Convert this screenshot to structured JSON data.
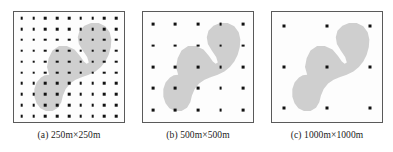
{
  "figure": {
    "background_color": "#ffffff",
    "panel_count": 3
  },
  "style": {
    "blob_fill": "#cfcfcf",
    "blob_stroke": "none",
    "dot_color": "#111111",
    "box_border_color": "#5a5a5a",
    "box_background": "#fdfdfd"
  },
  "chart_data": {
    "type": "scatter",
    "title": "",
    "subtitle": "",
    "xlabel": "",
    "ylabel": "",
    "xlim": [
      0,
      100
    ],
    "ylim": [
      0,
      100
    ],
    "grid": false,
    "legend": null,
    "shared_region": {
      "name": "shaded-region",
      "fill": "#cfcfcf",
      "polygon": [
        [
          32.0,
          57.0
        ],
        [
          30.0,
          50.0
        ],
        [
          31.5,
          42.0
        ],
        [
          35.0,
          35.0
        ],
        [
          41.0,
          31.0
        ],
        [
          48.0,
          31.0
        ],
        [
          55.0,
          34.0
        ],
        [
          60.0,
          40.0
        ],
        [
          63.5,
          45.0
        ],
        [
          66.0,
          47.0
        ],
        [
          68.0,
          46.0
        ],
        [
          66.5,
          41.0
        ],
        [
          62.5,
          35.0
        ],
        [
          59.0,
          29.0
        ],
        [
          58.0,
          23.0
        ],
        [
          59.5,
          17.0
        ],
        [
          64.0,
          12.5
        ],
        [
          70.0,
          10.0
        ],
        [
          77.0,
          10.0
        ],
        [
          83.0,
          13.0
        ],
        [
          87.0,
          18.5
        ],
        [
          88.5,
          25.0
        ],
        [
          88.0,
          32.0
        ],
        [
          86.0,
          39.0
        ],
        [
          83.0,
          45.0
        ],
        [
          79.0,
          50.0
        ],
        [
          74.0,
          54.0
        ],
        [
          68.0,
          57.0
        ],
        [
          62.0,
          59.0
        ],
        [
          56.0,
          61.5
        ],
        [
          51.0,
          65.0
        ],
        [
          47.0,
          70.0
        ],
        [
          44.5,
          76.0
        ],
        [
          43.0,
          82.0
        ],
        [
          40.0,
          87.0
        ],
        [
          35.0,
          90.0
        ],
        [
          29.0,
          90.0
        ],
        [
          24.0,
          87.5
        ],
        [
          20.5,
          83.0
        ],
        [
          18.5,
          77.0
        ],
        [
          18.5,
          70.0
        ],
        [
          20.5,
          64.0
        ],
        [
          24.5,
          59.5
        ],
        [
          28.0,
          57.5
        ]
      ]
    },
    "panels": [
      {
        "id": "a",
        "label": "(a) 250m×250m",
        "cell_size_m": 250,
        "extent_m": "250m×250m",
        "grid_cols": 9,
        "grid_rows": 10,
        "sensor_count": 90,
        "dot_size_px": 2.6,
        "x_start_pct": 7.0,
        "x_step_pct": 10.75,
        "y_start_pct": 5.5,
        "y_step_pct": 9.9
      },
      {
        "id": "b",
        "label": "(b) 500m×500m",
        "cell_size_m": 500,
        "extent_m": "500m×500m",
        "grid_cols": 5,
        "grid_rows": 5,
        "sensor_count": 25,
        "dot_size_px": 2.8,
        "x_start_pct": 9.0,
        "x_step_pct": 20.5,
        "y_start_pct": 11.0,
        "y_step_pct": 19.5
      },
      {
        "id": "c",
        "label": "(c) 1000m×1000m",
        "cell_size_m": 1000,
        "extent_m": "1000m×1000m",
        "grid_cols": 3,
        "grid_rows": 3,
        "sensor_count": 9,
        "dot_size_px": 3.0,
        "x_start_pct": 11.0,
        "x_step_pct": 39.0,
        "y_start_pct": 13.0,
        "y_step_pct": 37.0
      }
    ]
  }
}
